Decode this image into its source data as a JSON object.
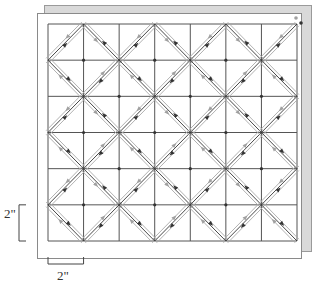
{
  "diagram": {
    "grid": {
      "columns": 7,
      "rows": 6,
      "left": 48,
      "top": 24,
      "right": 297,
      "bottom": 241
    },
    "back_sheet": {
      "x": 44,
      "y": 5,
      "width": 267,
      "height": 246,
      "fill": "#d9d9d9",
      "stroke": "#9a9a9a"
    },
    "front_sheet": {
      "x": 37,
      "y": 13,
      "width": 264,
      "height": 245,
      "fill": "#ffffff",
      "stroke": "#8a8a8a"
    },
    "colors": {
      "grid_line": "#555555",
      "path_center": "#333333",
      "path_side": "#a8a8a8",
      "arrow_dark": "#333333",
      "arrow_light": "#a0a0a0"
    },
    "start_marker": {
      "label": "start",
      "x": 299,
      "y": 20
    }
  },
  "dimensions": {
    "vertical": {
      "label": "2\"",
      "cell_span": 1
    },
    "horizontal": {
      "label": "2\"",
      "cell_span": 1
    }
  }
}
